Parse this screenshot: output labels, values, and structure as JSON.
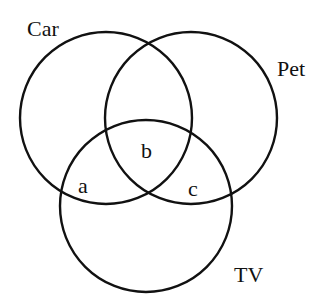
{
  "diagram": {
    "type": "venn",
    "sets": [
      {
        "id": "car",
        "label": "Car"
      },
      {
        "id": "pet",
        "label": "Pet"
      },
      {
        "id": "tv",
        "label": "TV"
      }
    ],
    "regions": [
      {
        "id": "car-tv-only",
        "label": "a",
        "sets": [
          "car",
          "tv"
        ]
      },
      {
        "id": "car-pet-tv",
        "label": "b",
        "sets": [
          "car",
          "pet",
          "tv"
        ]
      },
      {
        "id": "pet-tv-only",
        "label": "c",
        "sets": [
          "pet",
          "tv"
        ]
      }
    ],
    "colors": {
      "stroke": "#111111",
      "background": "#ffffff"
    }
  }
}
